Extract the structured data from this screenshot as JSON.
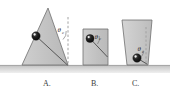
{
  "figure": {
    "canvas": {
      "width": 170,
      "height": 91,
      "background": "#ffffff"
    },
    "ground": {
      "name": "ground-surface",
      "fill": "#c9c9c9",
      "top_y": 65,
      "height": 7,
      "shadow_fill": "#e0e0e0"
    },
    "palette": {
      "body_fill": "#c4c4c4",
      "body_fill_light": "#d2d2d2",
      "body_stroke": "#6e6e6e",
      "ball_fill": "#1a1a1a",
      "ball_highlight": "#ffffff",
      "line_stroke": "#4a4a4a",
      "dash_stroke": "#8a8a8a",
      "text_color": "#3a3a3a"
    },
    "items": [
      {
        "id": "A",
        "label": "A.",
        "label_x": 43,
        "label_y": 86,
        "shape": "triangle",
        "points": "48,8 22,65 68,65",
        "ball": {
          "cx": 36,
          "cy": 36,
          "r": 4.2
        },
        "angle_line": {
          "x1": 36,
          "y1": 36,
          "x2": 67.5,
          "y2": 65
        },
        "dashed_line": {
          "x1": 68,
          "y1": 17,
          "x2": 68,
          "y2": 66
        },
        "angle_symbol": "θ",
        "angle_subscript": "c",
        "angle_label_x": 58,
        "angle_label_y": 32,
        "arc": {
          "d": "M 63 38 A 9 9 0 0 0 66.5 30"
        }
      },
      {
        "id": "B",
        "label": "B.",
        "label_x": 92,
        "label_y": 86,
        "shape": "rect",
        "points": "83,29 108,29 108,65 83,65",
        "ball": {
          "cx": 90,
          "cy": 38.5,
          "r": 4.0
        },
        "angle_line": {
          "x1": 90,
          "y1": 38.5,
          "x2": 107.5,
          "y2": 57
        },
        "dashed_line": null,
        "angle_symbol": "θ",
        "angle_subscript": "c",
        "angle_label_x": 95,
        "angle_label_y": 38,
        "arc": {
          "d": "M 98 42 A 8.5 8.5 0 0 0 99.5 35"
        }
      },
      {
        "id": "C",
        "label": "C.",
        "label_x": 133,
        "label_y": 86,
        "shape": "trapezoid",
        "points": "122,20 152,20 148,65 127,65",
        "ball": {
          "cx": 137,
          "cy": 58,
          "r": 4.2
        },
        "angle_line": {
          "x1": 137,
          "y1": 58,
          "x2": 147.5,
          "y2": 64.5
        },
        "dashed_line": {
          "x1": 146,
          "y1": 28,
          "x2": 146,
          "y2": 64
        },
        "angle_symbol": "θ",
        "angle_subscript": "c",
        "angle_label_x": 138,
        "angle_label_y": 51,
        "arc": {
          "d": "M 142 55 A 7 7 0 0 0 144 49"
        }
      }
    ]
  }
}
